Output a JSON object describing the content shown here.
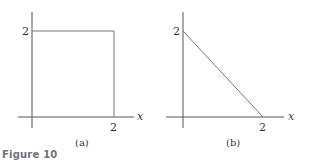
{
  "figure": {
    "title": "Figure 10",
    "panels": [
      {
        "id": "a",
        "caption": "(a)",
        "x_axis_label": "x",
        "x_tick": "2",
        "y_tick": "2",
        "shape": "square",
        "vertices": [
          [
            0,
            2
          ],
          [
            2,
            2
          ],
          [
            2,
            0
          ]
        ]
      },
      {
        "id": "b",
        "caption": "(b)",
        "x_axis_label": "x",
        "x_tick": "2",
        "y_tick": "2",
        "shape": "triangle",
        "vertices": [
          [
            0,
            2
          ],
          [
            2,
            0
          ]
        ]
      }
    ]
  }
}
